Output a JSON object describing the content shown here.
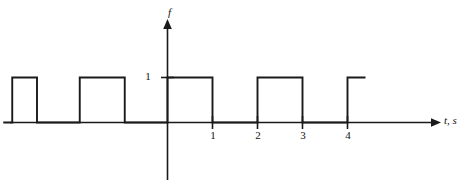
{
  "figure": {
    "name": "square-wave-plot",
    "background": "#ffffff",
    "stroke_color": "#1a1a1a",
    "width": 470,
    "height": 187
  },
  "axes": {
    "y": {
      "label": "f",
      "tick_labels": [
        "1"
      ],
      "tick_values": [
        1
      ]
    },
    "x": {
      "label": "t, s",
      "tick_labels": [
        "1",
        "2",
        "3",
        "4"
      ],
      "tick_values": [
        1,
        2,
        3,
        4
      ]
    }
  },
  "chart_data": {
    "type": "line",
    "title": "",
    "xlabel": "t, s",
    "ylabel": "f",
    "grid": false,
    "legend": null,
    "xlim": [
      -3.65,
      5.95
    ],
    "ylim": [
      -1.3,
      2.3
    ],
    "amplitude": 1,
    "period": 2,
    "duty_cycle": 0.5,
    "high_intervals": [
      [
        -3.45,
        -2.9
      ],
      [
        -1.95,
        -0.95
      ],
      [
        0,
        1
      ],
      [
        2,
        3
      ],
      [
        4,
        4.4
      ]
    ],
    "x": [
      -3.65,
      -3.45,
      -3.45,
      -2.9,
      -2.9,
      -1.95,
      -1.95,
      -0.95,
      -0.95,
      0,
      0,
      1,
      1,
      2,
      2,
      3,
      3,
      4,
      4,
      4.4
    ],
    "y": [
      0,
      0,
      1,
      1,
      0,
      0,
      1,
      1,
      0,
      0,
      1,
      1,
      0,
      0,
      1,
      1,
      0,
      0,
      1,
      1
    ]
  }
}
